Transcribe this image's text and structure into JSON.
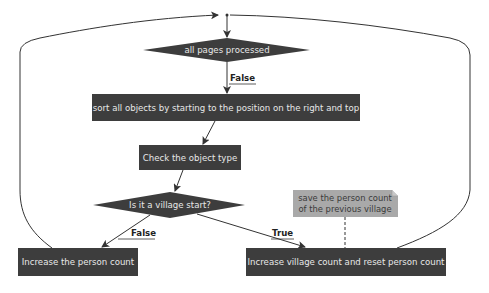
{
  "diagram": {
    "type": "flowchart",
    "colors": {
      "node_fill": "#3d3d3d",
      "node_text": "#e8e8e8",
      "note_fill": "#a9a9a9",
      "note_text": "#3a3a3a",
      "edge": "#333333"
    },
    "nodes": {
      "decision_pages": "all pages processed",
      "sort_objects": "sort all objects by starting to the position on the right and top",
      "check_type": "Check the object type",
      "decision_village": "Is it a village start?",
      "increase_person": "Increase the person count",
      "increase_village": "Increase village count and reset person count"
    },
    "note": {
      "line1": "save the person count",
      "line2": "of the previous village"
    },
    "edge_labels": {
      "pages_false": "False",
      "village_false": "False",
      "village_true": "True"
    },
    "edges": [
      {
        "from": "loop_top",
        "to": "decision_pages"
      },
      {
        "from": "decision_pages",
        "to": "sort_objects",
        "label": "False"
      },
      {
        "from": "sort_objects",
        "to": "check_type"
      },
      {
        "from": "check_type",
        "to": "decision_village"
      },
      {
        "from": "decision_village",
        "to": "increase_person",
        "label": "False"
      },
      {
        "from": "decision_village",
        "to": "increase_village",
        "label": "True"
      },
      {
        "from": "increase_person",
        "to": "loop_top"
      },
      {
        "from": "increase_village",
        "to": "loop_top"
      },
      {
        "from": "note",
        "to": "increase_village",
        "style": "dashed"
      }
    ]
  }
}
